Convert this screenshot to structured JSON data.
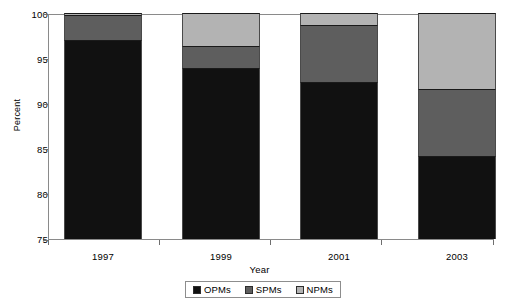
{
  "chart_data": {
    "type": "bar",
    "subtype": "stacked-bar-100",
    "title": "",
    "xlabel": "Year",
    "ylabel": "Percent",
    "categories": [
      "1997",
      "1999",
      "2001",
      "2003"
    ],
    "ylim": [
      75,
      100
    ],
    "yticks": [
      75,
      80,
      85,
      90,
      95,
      100
    ],
    "ytick_labels": [
      "75",
      "80",
      "85",
      "90",
      "95",
      "100"
    ],
    "grid": false,
    "legend_position": "bottom-center",
    "series": [
      {
        "name": "OPMs",
        "color": "#111111",
        "values": [
          97.0,
          93.9,
          92.4,
          84.2
        ],
        "cumulative_top": [
          97.0,
          93.9,
          92.4,
          84.2
        ]
      },
      {
        "name": "SPMs",
        "color": "#5e5e5e",
        "values": [
          2.8,
          2.4,
          6.3,
          7.4
        ],
        "cumulative_top": [
          99.8,
          96.3,
          98.7,
          91.6
        ]
      },
      {
        "name": "NPMs",
        "color": "#b3b3b3",
        "values": [
          0.2,
          3.7,
          1.3,
          8.4
        ],
        "cumulative_top": [
          100.0,
          100.0,
          100.0,
          100.0
        ]
      }
    ]
  },
  "axes": {
    "y_title": "Percent",
    "x_title": "Year",
    "y_tick_labels": [
      "100",
      "95",
      "90",
      "85",
      "80",
      "75"
    ],
    "x_tick_labels": [
      "1997",
      "1999",
      "2001",
      "2003"
    ]
  },
  "legend": {
    "items": [
      {
        "label": "OPMs",
        "color": "#111111"
      },
      {
        "label": "SPMs",
        "color": "#5e5e5e"
      },
      {
        "label": "NPMs",
        "color": "#b3b3b3"
      }
    ]
  }
}
